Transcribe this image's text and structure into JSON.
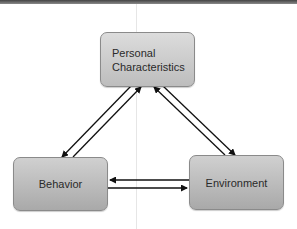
{
  "diagram": {
    "nodes": [
      {
        "id": "personal",
        "label": "Personal Characteristics",
        "line1": "Personal",
        "line2": "Characteristics"
      },
      {
        "id": "behavior",
        "label": "Behavior"
      },
      {
        "id": "environment",
        "label": "Environment"
      }
    ],
    "edges": [
      {
        "from": "personal",
        "to": "behavior"
      },
      {
        "from": "behavior",
        "to": "personal"
      },
      {
        "from": "personal",
        "to": "environment"
      },
      {
        "from": "environment",
        "to": "personal"
      },
      {
        "from": "environment",
        "to": "behavior"
      },
      {
        "from": "behavior",
        "to": "environment"
      }
    ]
  }
}
